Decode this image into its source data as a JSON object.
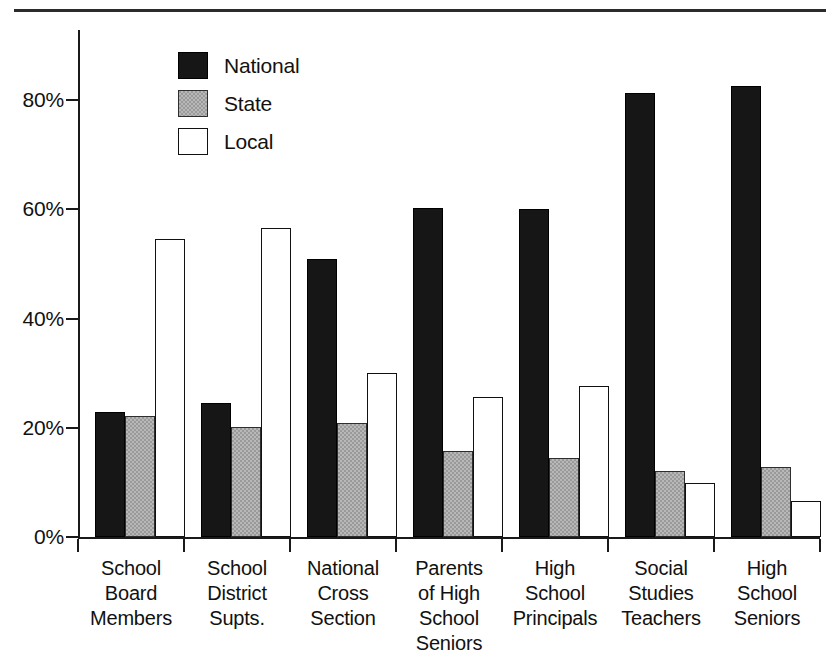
{
  "figure": {
    "background_color": "#ffffff",
    "rule_color": "#2b2b2b",
    "axis_color": "#1a1a1a"
  },
  "legend": {
    "position": "top-center-left",
    "entries": [
      {
        "label": "National",
        "color": "#161616",
        "swatch": "national"
      },
      {
        "label": "State",
        "color": "#9a9a9a",
        "swatch": "state"
      },
      {
        "label": "Local",
        "color": "#ffffff",
        "swatch": "local"
      }
    ]
  },
  "axis": {
    "y_ticks": [
      {
        "label": "0%",
        "value": 0
      },
      {
        "label": "20%",
        "value": 20
      },
      {
        "label": "40%",
        "value": 40
      },
      {
        "label": "60%",
        "value": 60
      },
      {
        "label": "80%",
        "value": 80
      }
    ]
  },
  "chart_data": {
    "type": "bar",
    "title": "",
    "subtitle": "",
    "xlabel": "",
    "ylabel": "",
    "ylim": [
      0,
      90
    ],
    "grid": false,
    "legend_position": "upper-left-inside",
    "tick_format": "percent",
    "categories": [
      "School Board Members",
      "School District Supts.",
      "National Cross Section",
      "Parents of High School Seniors",
      "High School Principals",
      "Social Studies Teachers",
      "High School Seniors"
    ],
    "category_lines": [
      [
        "School",
        "Board",
        "Members"
      ],
      [
        "School",
        "District",
        "Supts."
      ],
      [
        "National",
        "Cross",
        "Section"
      ],
      [
        "Parents",
        "of High",
        "School",
        "Seniors"
      ],
      [
        "High",
        "School",
        "Principals"
      ],
      [
        "Social",
        "Studies",
        "Teachers"
      ],
      [
        "High",
        "School",
        "Seniors"
      ]
    ],
    "series": [
      {
        "name": "National",
        "color": "#161616",
        "values": [
          22.8,
          24.5,
          50.9,
          60.2,
          60.0,
          81.2,
          82.5
        ]
      },
      {
        "name": "State",
        "color": "#9a9a9a",
        "values": [
          22.1,
          20.2,
          20.8,
          15.8,
          14.4,
          12.0,
          12.8
        ]
      },
      {
        "name": "Local",
        "color": "#ffffff",
        "values": [
          54.5,
          56.6,
          30.1,
          25.7,
          27.6,
          9.8,
          6.5
        ]
      }
    ]
  }
}
